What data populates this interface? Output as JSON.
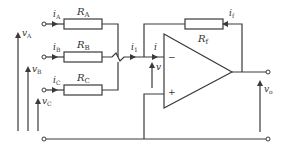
{
  "diagram": {
    "title": "",
    "type": "inverting summing amplifier",
    "colors": {
      "stroke": "#3a3a3a",
      "background": "#ffffff",
      "resistor_fill": "#ffffff"
    },
    "inputs": [
      {
        "current": "i",
        "current_sub": "A",
        "resistor": "R",
        "resistor_sub": "A",
        "voltage": "v",
        "voltage_sub": "A"
      },
      {
        "current": "i",
        "current_sub": "B",
        "resistor": "R",
        "resistor_sub": "B",
        "voltage": "v",
        "voltage_sub": "B"
      },
      {
        "current": "i",
        "current_sub": "C",
        "resistor": "R",
        "resistor_sub": "C",
        "voltage": "v",
        "voltage_sub": "C"
      }
    ],
    "junction_current": {
      "sym": "i",
      "sub": "1"
    },
    "opamp_input_current": {
      "sym": "i"
    },
    "opamp_input_voltage": {
      "sym": "v"
    },
    "feedback": {
      "resistor": "R",
      "resistor_sub": "f",
      "current": "i",
      "current_sub": "f"
    },
    "opamp": {
      "minus": "−",
      "plus": "+"
    },
    "output": {
      "voltage": "v",
      "voltage_sub": "o"
    }
  }
}
